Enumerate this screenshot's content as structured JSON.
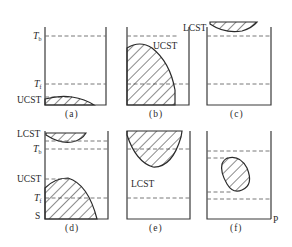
{
  "figure": {
    "panels": [
      {
        "id": "a",
        "caption": "(a)",
        "labels": {
          "tb": "T",
          "tb_sub": "b",
          "tf": "T",
          "tf_sub": "f",
          "ucst": "UCST"
        }
      },
      {
        "id": "b",
        "caption": "(b)",
        "labels": {
          "ucst": "UCST"
        }
      },
      {
        "id": "c",
        "caption": "(c)",
        "labels": {
          "lcst": "LCST"
        }
      },
      {
        "id": "d",
        "caption": "(d)",
        "labels": {
          "lcst": "LCST",
          "tb": "T",
          "tb_sub": "b",
          "ucst": "UCST",
          "tf": "T",
          "tf_sub": "f",
          "s": "S"
        }
      },
      {
        "id": "e",
        "caption": "(e)",
        "labels": {
          "lcst": "LCST"
        }
      },
      {
        "id": "f",
        "caption": "(f)",
        "labels": {
          "p": "P"
        }
      }
    ],
    "hatch_color": "#2a2a2a",
    "line_color": "#3a3a3a"
  }
}
